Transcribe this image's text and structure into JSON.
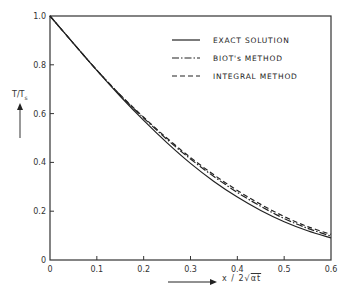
{
  "chart_data": {
    "type": "line",
    "title": "",
    "xlabel": "x / 2√(αt)",
    "ylabel": "T/Ts",
    "xlim": [
      0,
      0.6
    ],
    "ylim": [
      0,
      1.0
    ],
    "grid": false,
    "legend_position": "upper right",
    "x_ticks": [
      "0",
      "0.1",
      "0.2",
      "0.3",
      "0.4",
      "0.5",
      "0.6"
    ],
    "y_ticks": [
      "0",
      "0.2",
      "0.4",
      "0.6",
      "0.8",
      "1.0"
    ],
    "x": [
      0,
      0.05,
      0.1,
      0.15,
      0.2,
      0.25,
      0.3,
      0.35,
      0.4,
      0.45,
      0.5,
      0.55,
      0.6
    ],
    "series": [
      {
        "name": "EXACT SOLUTION",
        "style": "solid",
        "values": [
          1.0,
          0.888,
          0.777,
          0.671,
          0.572,
          0.48,
          0.396,
          0.322,
          0.258,
          0.203,
          0.157,
          0.12,
          0.09
        ]
      },
      {
        "name": "BIOT's METHOD",
        "style": "dash-dot",
        "values": [
          1.0,
          0.888,
          0.778,
          0.676,
          0.582,
          0.494,
          0.414,
          0.342,
          0.277,
          0.22,
          0.17,
          0.13,
          0.098
        ]
      },
      {
        "name": "INTEGRAL METHOD",
        "style": "dashed",
        "values": [
          1.0,
          0.888,
          0.778,
          0.677,
          0.585,
          0.499,
          0.42,
          0.349,
          0.285,
          0.228,
          0.178,
          0.137,
          0.105
        ]
      }
    ]
  },
  "labels": {
    "y_axis": "T/T",
    "y_axis_sub": "s",
    "x_axis": "x / 2",
    "x_axis_root": "αt"
  }
}
